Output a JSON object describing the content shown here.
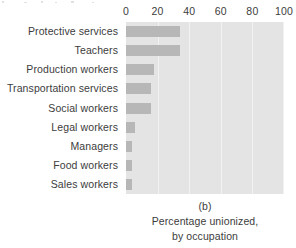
{
  "chart_data": {
    "type": "bar",
    "orientation": "horizontal",
    "title": "",
    "panel_letter": "(b)",
    "caption_lines": [
      "Percentage unionized,",
      "by occupation"
    ],
    "xlabel": "",
    "ylabel": "",
    "xlim": [
      0,
      100
    ],
    "xticks": [
      0,
      20,
      40,
      60,
      80,
      100
    ],
    "xtick_labels": [
      "0",
      "20",
      "40",
      "60",
      "80",
      "100"
    ],
    "grid": "vertical",
    "legend": "none",
    "categories": [
      "Protective services",
      "Teachers",
      "Production workers",
      "Transportation services",
      "Social workers",
      "Legal workers",
      "Managers",
      "Food workers",
      "Sales workers"
    ],
    "values": [
      34,
      34,
      18,
      16,
      16,
      6,
      4,
      4,
      4
    ],
    "bar_color": "#b7b7b7",
    "plot_background": "#e4e4e4",
    "gridline_color": "#f2f2f2",
    "text_color": "#3c3c3c",
    "page_background": "#ffffff"
  }
}
